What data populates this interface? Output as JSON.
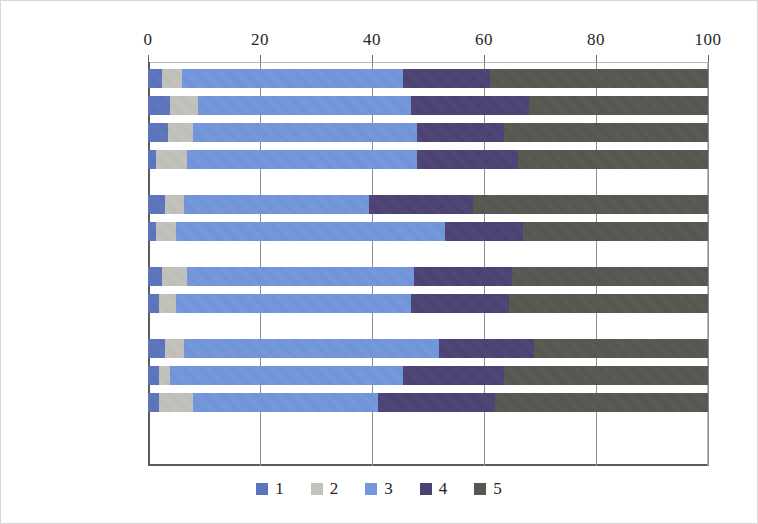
{
  "chart_data": {
    "type": "bar",
    "orientation": "horizontal",
    "stacked": true,
    "title": "",
    "subtitle": "",
    "xlabel": "",
    "ylabel": "",
    "xlim": [
      0,
      100
    ],
    "xticks": [
      0,
      20,
      40,
      60,
      80,
      100
    ],
    "xtick_labels": [
      "0",
      "20",
      "40",
      "60",
      "80",
      "100"
    ],
    "grid": true,
    "grid_axis": "x",
    "legend_position": "bottom",
    "legend": [
      "1",
      "2",
      "3",
      "4",
      "5"
    ],
    "series_colors": [
      "#5a74bd",
      "#c3c3bd",
      "#7396dd",
      "#4b4274",
      "#575751"
    ],
    "categories": [
      "18—29岁",
      "30—49岁",
      "50—64岁",
      "65+岁",
      "男性",
      "女性",
      "城市",
      "农村",
      "初等教育",
      "中等教育",
      "高等教育"
    ],
    "group_breaks_after": [
      3,
      5,
      7
    ],
    "series": [
      {
        "name": "1",
        "values": [
          2.5,
          4.0,
          3.5,
          1.5,
          3.0,
          1.5,
          2.5,
          2.0,
          3.0,
          2.0,
          2.0
        ]
      },
      {
        "name": "2",
        "values": [
          3.5,
          5.0,
          4.5,
          5.5,
          3.5,
          3.5,
          4.5,
          3.0,
          3.5,
          2.0,
          6.0
        ]
      },
      {
        "name": "3",
        "values": [
          39.5,
          38.0,
          40.0,
          41.0,
          33.0,
          48.0,
          40.5,
          42.0,
          45.5,
          41.5,
          33.0
        ]
      },
      {
        "name": "4",
        "values": [
          15.5,
          21.0,
          15.5,
          18.0,
          18.5,
          14.0,
          17.5,
          17.5,
          17.0,
          18.0,
          21.0
        ]
      },
      {
        "name": "5",
        "values": [
          39.0,
          32.0,
          36.5,
          34.0,
          42.0,
          33.0,
          35.0,
          35.5,
          31.0,
          36.5,
          38.0
        ]
      }
    ]
  }
}
